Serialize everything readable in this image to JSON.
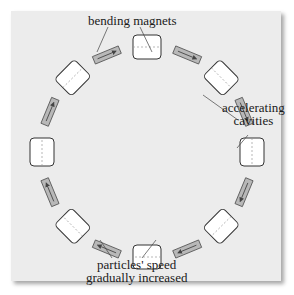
{
  "diagram": {
    "type": "circular particle accelerator (synchrotron ring)",
    "labels": {
      "bending_magnets": "bending magnets",
      "accelerating_line1": "accelerating",
      "accelerating_line2": "cavities",
      "speed_line1": "particles' speed",
      "speed_line2": "gradually increased"
    },
    "cavity_count": 8,
    "magnet_count": 8,
    "direction": "clockwise",
    "colors": {
      "panel": "#ececec",
      "cavity_fill": "#ffffff",
      "cavity_stroke": "#333333",
      "magnet_fill": "#b8b8b8",
      "magnet_stroke": "#555555",
      "arrow": "#444444"
    }
  }
}
